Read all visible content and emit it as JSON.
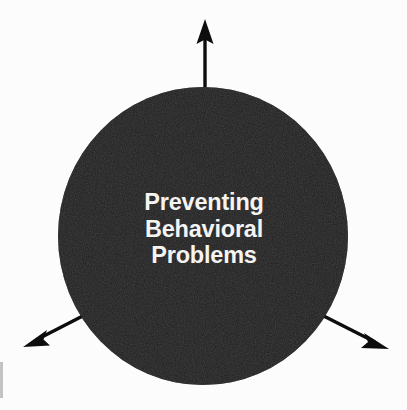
{
  "diagram": {
    "type": "hub-and-spoke",
    "background_color": "#fdfdfd",
    "hub": {
      "shape": "circle",
      "fill_color": "#0d0d0d",
      "center_x": 203,
      "center_y": 236,
      "radius_x": 145,
      "radius_y": 149,
      "label_color": "#f4f4f2",
      "label_lines": [
        "Preventing",
        "Behavioral",
        "Problems"
      ],
      "label_full": "Preventing Behavioral Problems"
    },
    "arrows": [
      {
        "name": "arrow-up",
        "direction": "up",
        "color": "#0d0d0d",
        "from_x": 205,
        "from_y": 95,
        "to_x": 205,
        "to_y": 20
      },
      {
        "name": "arrow-down-left",
        "direction": "down-left",
        "color": "#0d0d0d",
        "from_x": 95,
        "from_y": 310,
        "to_x": 24,
        "to_y": 346
      },
      {
        "name": "arrow-down-right",
        "direction": "down-right",
        "color": "#0d0d0d",
        "from_x": 315,
        "from_y": 312,
        "to_x": 388,
        "to_y": 348
      }
    ],
    "artifacts": {
      "left_edge_streak_color": "#b9b9b9"
    }
  }
}
